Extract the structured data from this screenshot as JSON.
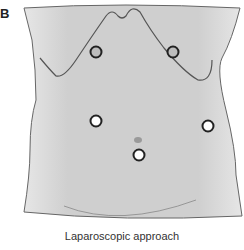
{
  "figure": {
    "panel_label": "B",
    "caption": "Laparoscopic approach",
    "colors": {
      "skin_fill": "#d2d2d2",
      "outline": "#555555",
      "port_fill_dark": "#bdbdbd",
      "port_fill_light": "#ffffff",
      "port_stroke": "#222222",
      "navel": "#9a9a9a"
    },
    "ports": [
      {
        "name": "upper-left-port",
        "x": 96,
        "y": 52,
        "style": "dark"
      },
      {
        "name": "upper-right-port",
        "x": 173,
        "y": 52,
        "style": "dark"
      },
      {
        "name": "mid-left-port",
        "x": 96,
        "y": 121,
        "style": "light"
      },
      {
        "name": "mid-right-port",
        "x": 208,
        "y": 126,
        "style": "light"
      },
      {
        "name": "lower-center-port",
        "x": 139,
        "y": 155,
        "style": "light"
      }
    ],
    "navel": {
      "x": 138,
      "y": 140
    }
  }
}
